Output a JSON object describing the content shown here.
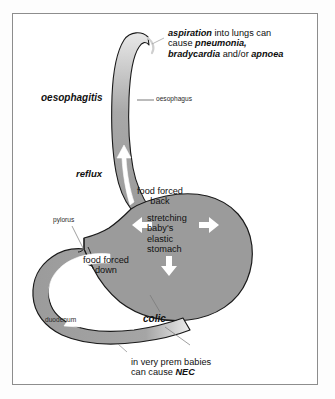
{
  "diagram": {
    "colors": {
      "organ_fill": "#9b9b9b",
      "organ_outline": "#1a1a1a",
      "arrow_fill": "#ffffff",
      "frame_border": "#8d8d8d",
      "background": "#ffffff",
      "text": "#111111"
    },
    "annotations": {
      "aspiration": {
        "name": "aspiration-callout",
        "line1_em": "aspiration",
        "line1_rest": " into lungs can",
        "line2_pre": "cause ",
        "line2_em": "pneumonia,",
        "line3_em1": "bradycardia",
        "line3_mid": " and/or ",
        "line3_em2": "apnoea"
      },
      "oesophagitis": {
        "name": "oesophagitis-label",
        "text": "oesophagitis"
      },
      "oesophagus": {
        "name": "oesophagus-label",
        "text": "oesophagus"
      },
      "reflux": {
        "name": "reflux-label",
        "text": "reflux"
      },
      "food_forced_back": {
        "name": "food-forced-back-label",
        "line1": "food forced",
        "line2": "back"
      },
      "stretching": {
        "name": "stretching-stomach-label",
        "line1": "stretching",
        "line2": "baby's",
        "line3": "elastic",
        "line4": "stomach"
      },
      "pylorus": {
        "name": "pylorus-label",
        "text": "pylorus"
      },
      "food_forced_down": {
        "name": "food-forced-down-label",
        "line1": "food forced",
        "line2": "down"
      },
      "duodenum": {
        "name": "duodenum-label",
        "text": "duodenum"
      },
      "colic": {
        "name": "colic-label",
        "text": "colic"
      },
      "nec": {
        "name": "nec-callout",
        "line1": "in very prem babies",
        "line2_pre": "can cause ",
        "line2_em": "NEC"
      }
    },
    "anatomy": [
      {
        "name": "oesophagus-shape",
        "label": "oesophagus"
      },
      {
        "name": "stomach-shape",
        "label": "stomach"
      },
      {
        "name": "duodenum-shape",
        "label": "duodenum"
      },
      {
        "name": "pylorus-notch",
        "label": "pylorus"
      }
    ],
    "flow_arrows": [
      {
        "name": "reflux-up-arrow",
        "direction": "up",
        "meaning": "reflux / food forced back"
      },
      {
        "name": "stretch-left-arrow",
        "direction": "left",
        "meaning": "stomach stretching"
      },
      {
        "name": "stretch-right-arrow",
        "direction": "right",
        "meaning": "stomach stretching"
      },
      {
        "name": "stretch-down-arrow",
        "direction": "down",
        "meaning": "stomach stretching"
      },
      {
        "name": "food-down-arrow",
        "direction": "down-curve",
        "meaning": "food forced down into duodenum"
      }
    ]
  }
}
